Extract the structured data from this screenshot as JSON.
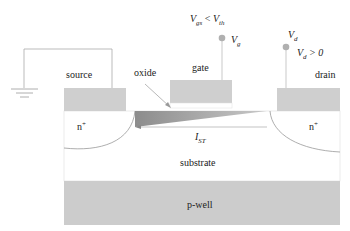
{
  "diagram": {
    "type": "MOSFET cross-section (subthreshold conduction)",
    "colors": {
      "electrode": "#cfcfcf",
      "pwell": "#cccccc",
      "channel": "#9a9a9a",
      "wire": "#aaaaaa",
      "pin_dot": "#b0b0b0",
      "outline": "#999999"
    },
    "labels": {
      "source": "source",
      "gate": "gate",
      "drain": "drain",
      "oxide": "oxide",
      "n_plus_left": "n",
      "n_plus_right": "n",
      "n_plus_sup": "+",
      "substrate": "substrate",
      "pwell": "p-well",
      "current_main": "I",
      "current_sub": "ST",
      "vg_main": "V",
      "vg_sub": "g",
      "vd_main": "V",
      "vd_sub": "d",
      "cond_gate_v1": "V",
      "cond_gate_s1": "gs",
      "cond_gate_op": " < ",
      "cond_gate_v2": "V",
      "cond_gate_s2": "th",
      "cond_drain_v": "V",
      "cond_drain_s": "d",
      "cond_drain_rest": " > 0"
    }
  }
}
